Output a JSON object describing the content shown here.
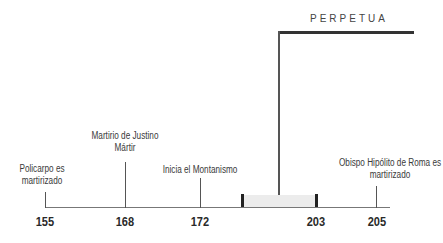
{
  "diagram": {
    "type": "timeline",
    "person": {
      "label": "PERPETUA",
      "span_start": 203,
      "span_end": 205
    },
    "events": [
      {
        "year": "155",
        "label_line1": "Policarpo es",
        "label_line2": "martirizado"
      },
      {
        "year": "168",
        "label_line1": "Martirio de Justino",
        "label_line2": "Mártir"
      },
      {
        "year": "172",
        "label_line1": "Inicia el Montanismo",
        "label_line2": ""
      },
      {
        "year": "203",
        "label_line1": "",
        "label_line2": ""
      },
      {
        "year": "205",
        "label_line1": "Obispo Hipólito de Roma es",
        "label_line2": "martirizado"
      }
    ],
    "colors": {
      "axis": "#777777",
      "text": "#333333",
      "highlight_band": "#ececec",
      "perpetua_bar": "#333333"
    }
  }
}
